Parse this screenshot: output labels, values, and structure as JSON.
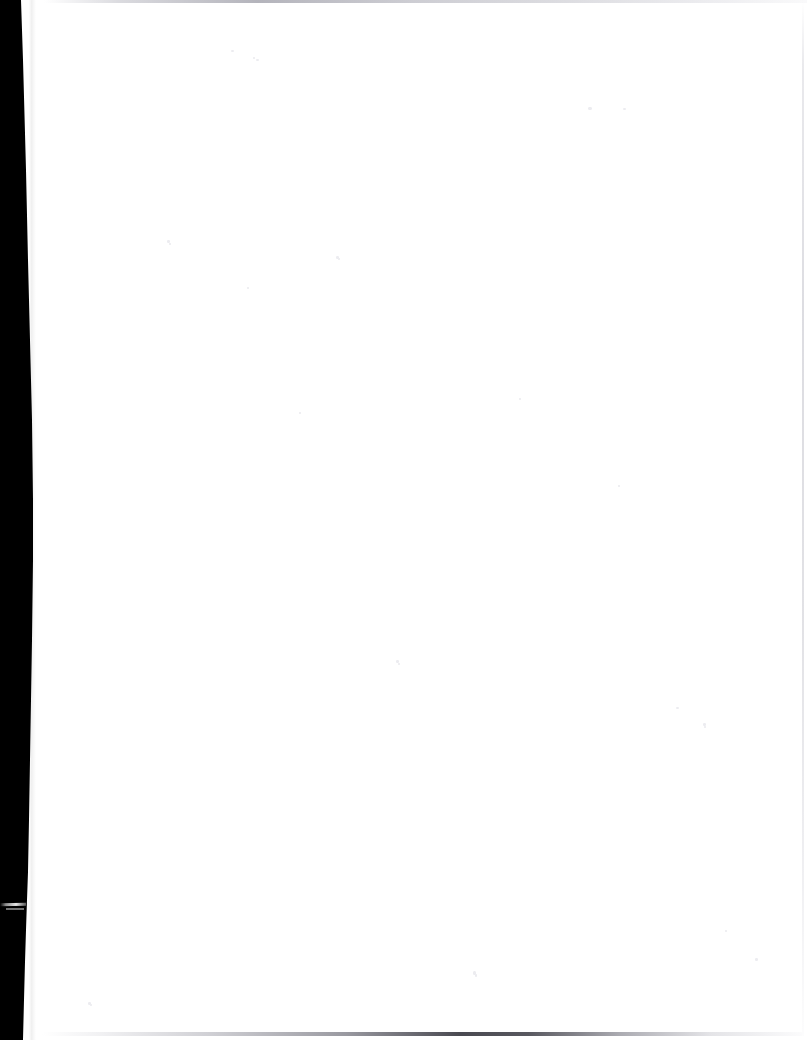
{
  "document": {
    "kind": "scanned-page",
    "page_content": "",
    "page_state": "blank",
    "visible_text": "",
    "width_px": 807,
    "height_px": 1040
  },
  "colors": {
    "paper": "#ffffff",
    "gutter_band": "#000000",
    "top_edge_line": "#b0b0b8",
    "bottom_edge_line": "#3a3a42",
    "right_edge_line": "#ced1d8",
    "speck": "#ececf0"
  },
  "artifacts": {
    "gutter_band_label": "",
    "gutter_nick_label": "",
    "top_edge_label": "",
    "bottom_edge_label": "",
    "right_edge_label": "",
    "specks": [
      {
        "x": 231,
        "y": 50,
        "w": 3,
        "h": 2
      },
      {
        "x": 253,
        "y": 57,
        "w": 2,
        "h": 2
      },
      {
        "x": 256,
        "y": 59,
        "w": 3,
        "h": 2
      },
      {
        "x": 588,
        "y": 107,
        "w": 4,
        "h": 3
      },
      {
        "x": 623,
        "y": 108,
        "w": 3,
        "h": 2
      },
      {
        "x": 167,
        "y": 240,
        "w": 3,
        "h": 3
      },
      {
        "x": 169,
        "y": 243,
        "w": 2,
        "h": 2
      },
      {
        "x": 336,
        "y": 256,
        "w": 3,
        "h": 3
      },
      {
        "x": 338,
        "y": 258,
        "w": 2,
        "h": 2
      },
      {
        "x": 247,
        "y": 287,
        "w": 2,
        "h": 2
      },
      {
        "x": 396,
        "y": 660,
        "w": 3,
        "h": 3
      },
      {
        "x": 398,
        "y": 663,
        "w": 2,
        "h": 2
      },
      {
        "x": 676,
        "y": 707,
        "w": 3,
        "h": 2
      },
      {
        "x": 703,
        "y": 723,
        "w": 3,
        "h": 3
      },
      {
        "x": 704,
        "y": 726,
        "w": 2,
        "h": 2
      },
      {
        "x": 755,
        "y": 958,
        "w": 3,
        "h": 3
      },
      {
        "x": 473,
        "y": 971,
        "w": 3,
        "h": 4
      },
      {
        "x": 475,
        "y": 974,
        "w": 2,
        "h": 3
      },
      {
        "x": 725,
        "y": 930,
        "w": 2,
        "h": 2
      },
      {
        "x": 88,
        "y": 1002,
        "w": 3,
        "h": 3
      },
      {
        "x": 90,
        "y": 1004,
        "w": 2,
        "h": 2
      },
      {
        "x": 299,
        "y": 412,
        "w": 2,
        "h": 2
      },
      {
        "x": 519,
        "y": 398,
        "w": 2,
        "h": 2
      },
      {
        "x": 618,
        "y": 485,
        "w": 2,
        "h": 2
      }
    ]
  }
}
